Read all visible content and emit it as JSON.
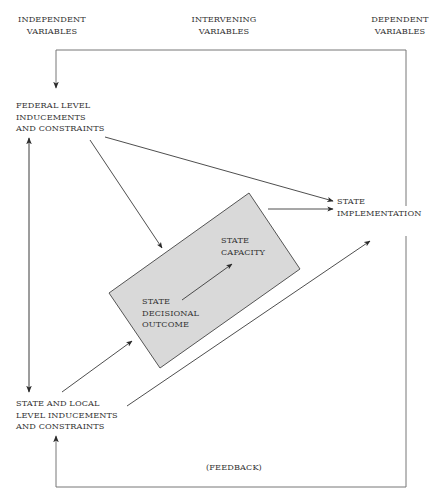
{
  "headers": {
    "independent": [
      "INDEPENDENT",
      "VARIABLES"
    ],
    "intervening": [
      "INTERVENING",
      "VARIABLES"
    ],
    "dependent": [
      "DEPENDENT",
      "VARIABLES"
    ]
  },
  "nodes": {
    "federal": [
      "FEDERAL LEVEL",
      "INDUCEMENTS",
      "AND CONSTRAINTS"
    ],
    "state_local": [
      "STATE AND LOCAL",
      "LEVEL INDUCEMENTS",
      "AND CONSTRAINTS"
    ],
    "state_implementation": [
      "STATE",
      "IMPLEMENTATION"
    ],
    "state_capacity": [
      "STATE",
      "CAPACITY"
    ],
    "state_decisional_outcome": [
      "STATE",
      "DECISIONAL",
      "OUTCOME"
    ]
  },
  "feedback_label": "(FEEDBACK)",
  "colors": {
    "line": "#3a3a3a",
    "box_fill": "#d9d9d9",
    "box_stroke": "#555555",
    "frame": "#777777"
  },
  "edges": [
    {
      "from": "federal",
      "to": "state_implementation"
    },
    {
      "from": "federal",
      "to": "intervening_box"
    },
    {
      "from": "state_local",
      "to": "intervening_box"
    },
    {
      "from": "state_local",
      "to": "state_implementation"
    },
    {
      "from": "intervening_box",
      "to": "state_implementation"
    },
    {
      "from": "state_decisional_outcome",
      "to": "state_capacity"
    },
    {
      "from": "federal",
      "to": "state_local",
      "bidirectional": true
    },
    {
      "from": "state_implementation",
      "to": "federal",
      "label": "feedback"
    },
    {
      "from": "state_implementation",
      "to": "state_local",
      "label": "feedback"
    }
  ]
}
